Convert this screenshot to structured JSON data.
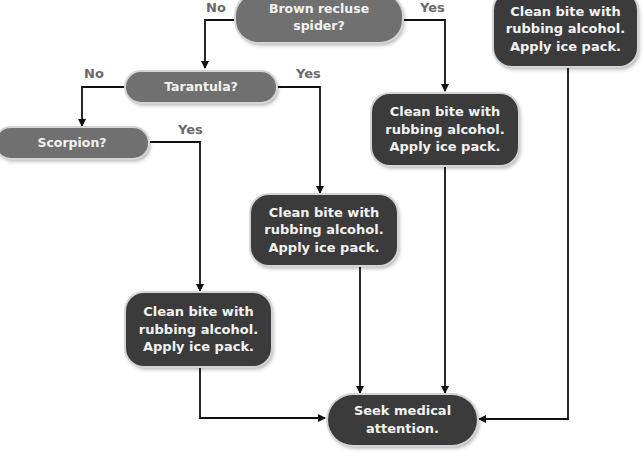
{
  "nodes": {
    "brown_recluse": {
      "lines": [
        "Brown recluse",
        "spider?"
      ]
    },
    "tarantula": {
      "lines": [
        "Tarantula?"
      ]
    },
    "scorpion": {
      "lines": [
        "Scorpion?"
      ]
    },
    "action_top_right": {
      "lines": [
        "Clean bite with",
        "rubbing alcohol.",
        "Apply ice pack."
      ]
    },
    "action_brown_recluse": {
      "lines": [
        "Clean bite with",
        "rubbing alcohol.",
        "Apply ice pack."
      ]
    },
    "action_tarantula": {
      "lines": [
        "Clean bite with",
        "rubbing alcohol.",
        "Apply ice pack."
      ]
    },
    "action_scorpion": {
      "lines": [
        "Clean bite with",
        "rubbing alcohol.",
        "Apply ice pack."
      ]
    },
    "seek_medical": {
      "lines": [
        "Seek medical",
        "attention."
      ]
    }
  },
  "edge_labels": {
    "brown_no": "No",
    "brown_yes": "Yes",
    "tarantula_no": "No",
    "tarantula_yes": "Yes",
    "scorpion_yes": "Yes"
  },
  "colors": {
    "question_fill": "#707070",
    "action_fill": "#3b3b3b",
    "line": "#111111",
    "label": "#6a6a6a"
  }
}
